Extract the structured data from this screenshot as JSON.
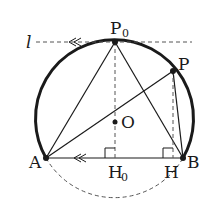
{
  "diagram": {
    "type": "geometry",
    "labels": {
      "l": "l",
      "P0": "P",
      "P0_sub": "0",
      "P": "P",
      "O": "O",
      "A": "A",
      "B": "B",
      "H0": "H",
      "H0_sub": "0",
      "H": "H"
    },
    "colors": {
      "stroke": "#1a1a1a",
      "dashed": "#555555"
    }
  }
}
